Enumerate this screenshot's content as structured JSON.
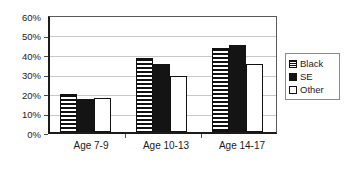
{
  "chart_data": {
    "type": "bar",
    "title": "",
    "subtitle": "",
    "xlabel": "",
    "ylabel": "",
    "categories": [
      "Age 7-9",
      "Age 10-13",
      "Age 14-17"
    ],
    "series": [
      {
        "name": "Black",
        "values": [
          20,
          38.5,
          44
        ],
        "pattern": "horizontal-stripes"
      },
      {
        "name": "SE",
        "values": [
          17,
          35.5,
          45.5
        ],
        "pattern": "solid-black"
      },
      {
        "name": "Other",
        "values": [
          17.5,
          29,
          35.5
        ],
        "pattern": "white-outline"
      }
    ],
    "ylim": [
      0,
      60
    ],
    "ytick_values": [
      0,
      10,
      20,
      30,
      40,
      50,
      60
    ],
    "ytick_labels": [
      "0%",
      "10%",
      "20%",
      "30%",
      "40%",
      "50%",
      "60%"
    ],
    "grid": true,
    "grid_axis": "y",
    "legend_position": "right",
    "legend_entries": [
      "Black",
      "SE",
      "Other"
    ],
    "annotations": []
  },
  "colors": {
    "axis": "#1b1b1b",
    "gridline": "#c8c8c8",
    "series_black": "#111111",
    "series_se": "#141414",
    "series_other": "#ffffff",
    "legend_border": "#8a8a8a",
    "background": "#ffffff"
  }
}
